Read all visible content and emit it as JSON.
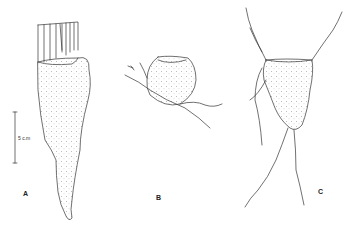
{
  "figure": {
    "panels": [
      {
        "id": "A",
        "label": "A"
      },
      {
        "id": "B",
        "label": "B"
      },
      {
        "id": "C",
        "label": "C"
      }
    ],
    "scale_bar": {
      "label": "5 c.m"
    }
  }
}
